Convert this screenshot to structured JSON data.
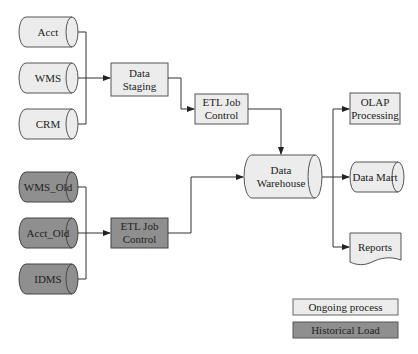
{
  "diagram": {
    "colors": {
      "ongoing_fill": "#ececec",
      "historical_fill": "#8f8f8f",
      "stroke": "#555555",
      "line": "#333333"
    },
    "sources_ongoing": [
      {
        "label": "Acct"
      },
      {
        "label": "WMS"
      },
      {
        "label": "CRM"
      }
    ],
    "sources_historical": [
      {
        "label": "WMS_Old"
      },
      {
        "label": "Acct_Old"
      },
      {
        "label": "IDMS"
      }
    ],
    "data_staging": {
      "line1": "Data",
      "line2": "Staging"
    },
    "etl_ongoing": {
      "line1": "ETL Job",
      "line2": "Control"
    },
    "etl_historical": {
      "line1": "ETL Job",
      "line2": "Control"
    },
    "data_warehouse": {
      "line1": "Data",
      "line2": "Warehouse"
    },
    "outputs": {
      "olap": {
        "line1": "OLAP",
        "line2": "Processing"
      },
      "data_mart": {
        "label": "Data Mart"
      },
      "reports": {
        "label": "Reports"
      }
    },
    "legend": {
      "ongoing": "Ongoing process",
      "historical": "Historical Load"
    }
  }
}
